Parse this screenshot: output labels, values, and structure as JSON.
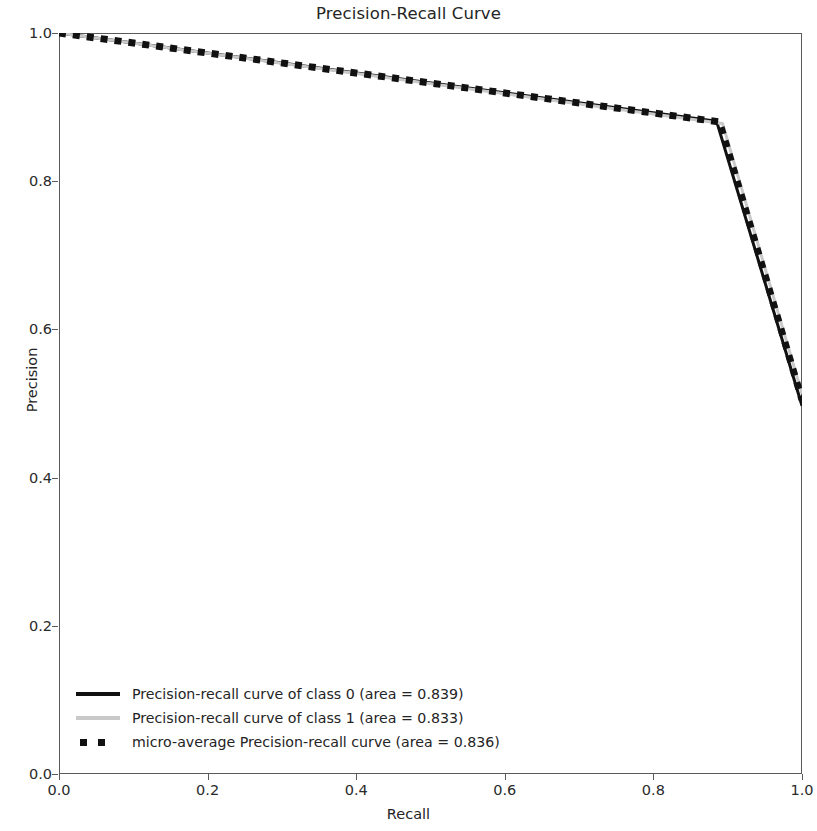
{
  "chart_data": {
    "type": "line",
    "title": "Precision-Recall Curve",
    "xlabel": "Recall",
    "ylabel": "Precision",
    "xlim": [
      0.0,
      1.0
    ],
    "ylim": [
      0.0,
      1.0
    ],
    "xticks": [
      "0.0",
      "0.2",
      "0.4",
      "0.6",
      "0.8",
      "1.0"
    ],
    "xtick_values": [
      0.0,
      0.2,
      0.4,
      0.6,
      0.8,
      1.0
    ],
    "yticks": [
      "0.0",
      "0.2",
      "0.4",
      "0.6",
      "0.8",
      "1.0"
    ],
    "ytick_values": [
      0.0,
      0.2,
      0.4,
      0.6,
      0.8,
      1.0
    ],
    "grid": false,
    "legend_position": "lower left",
    "series": [
      {
        "name": "Precision-recall curve of class 0 (area = 0.839)",
        "style": "solid",
        "color": "#111111",
        "area": 0.839,
        "x": [
          0.0,
          0.885,
          1.0
        ],
        "y": [
          1.0,
          0.881,
          0.497
        ]
      },
      {
        "name": "Precision-recall curve of class 1 (area = 0.833)",
        "style": "solid",
        "color": "#c9c9c9",
        "area": 0.833,
        "x": [
          0.0,
          0.893,
          1.0
        ],
        "y": [
          1.0,
          0.878,
          0.513
        ]
      },
      {
        "name": "micro-average Precision-recall curve (area = 0.836)",
        "style": "dotted",
        "color": "#111111",
        "area": 0.836,
        "x": [
          0.0,
          0.889,
          1.0
        ],
        "y": [
          1.0,
          0.88,
          0.505
        ]
      }
    ]
  },
  "axes": {
    "ylabel": "Precision",
    "xlabel": "Recall"
  },
  "title": {
    "text": "Precision-Recall Curve"
  },
  "legend": {
    "items": [
      {
        "label": "Precision-recall curve of class 0 (area = 0.839)"
      },
      {
        "label": "Precision-recall curve of class 1 (area = 0.833)"
      },
      {
        "label": "micro-average Precision-recall curve (area = 0.836)"
      }
    ]
  }
}
